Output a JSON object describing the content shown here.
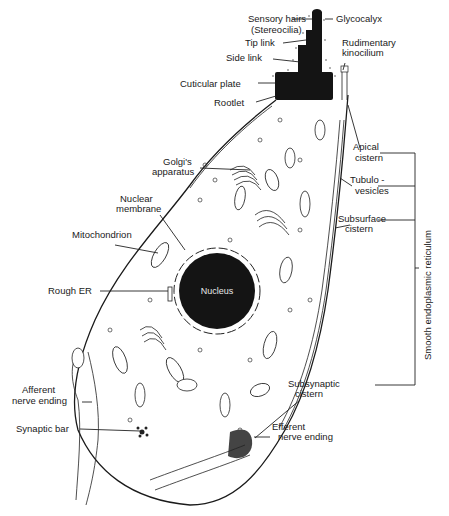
{
  "diagram": {
    "labels": {
      "sensory_hairs": "Sensory hairs",
      "stereocilia": "(Stereocilia)",
      "glycocalyx": "Glycocalyx",
      "tip_link": "Tip link",
      "rudimentary": "Rudimentary",
      "kinocilium": "kinocilium",
      "side_link": "Side link",
      "cuticular_plate": "Cuticular plate",
      "rootlet": "Rootlet",
      "apical": "Apical",
      "apical_cistern": "cistern",
      "golgi_1": "Golgi's",
      "golgi_2": "apparatus",
      "tubulo": "Tubulo -",
      "vesicles": "vesicles",
      "nuclear": "Nuclear",
      "membrane": "membrane",
      "subsurface": "Subsurface",
      "subsurface_cistern": "cistern",
      "mitochondrion": "Mitochondrion",
      "rough_er": "Rough ER",
      "nucleus": "Nucleus",
      "smooth_er": "Smooth endoplasmic reticulum",
      "afferent": "Afferent",
      "afferent_ending": "nerve ending",
      "subsynaptic": "Subsynaptic",
      "subsynaptic_cistern": "cistern",
      "synaptic_bar": "Synaptic bar",
      "efferent": "Efferent",
      "efferent_ending": "nerve ending"
    },
    "colors": {
      "ink": "#1a1a1a",
      "background": "#ffffff"
    }
  }
}
